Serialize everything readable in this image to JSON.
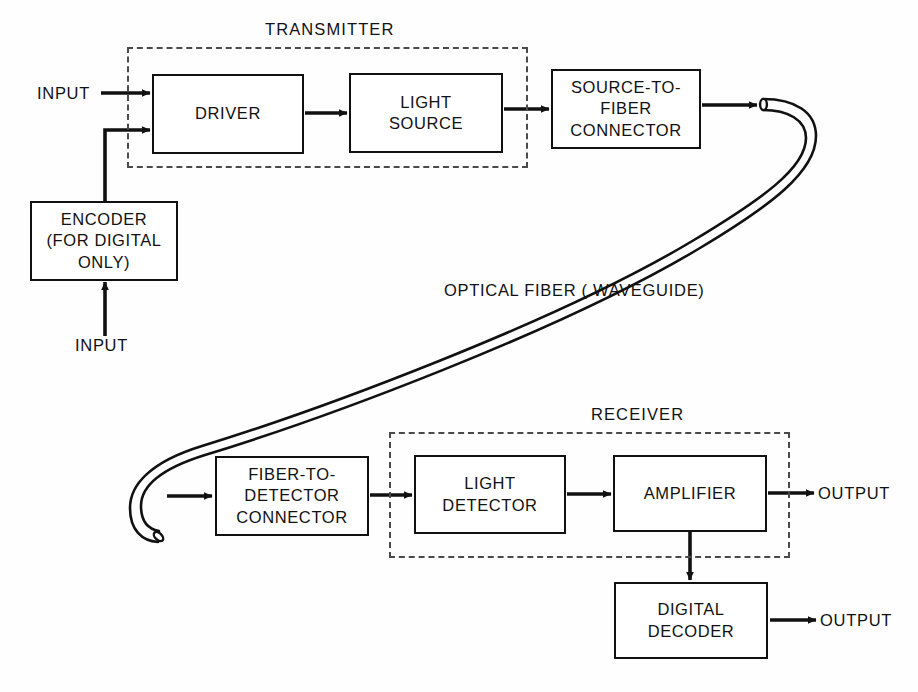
{
  "diagram": {
    "line_color": "#111111",
    "dash_color": "#4a4a4a",
    "background": "#fefefe"
  },
  "groups": {
    "transmitter": {
      "label": "TRANSMITTER"
    },
    "receiver": {
      "label": "RECEIVER"
    }
  },
  "blocks": {
    "driver": {
      "label": "DRIVER"
    },
    "light_source": {
      "label": "LIGHT\nSOURCE"
    },
    "source_to_fiber_connector": {
      "label": "SOURCE-TO-\nFIBER\nCONNECTOR"
    },
    "encoder": {
      "label": "ENCODER\n(FOR DIGITAL\nONLY)"
    },
    "fiber_to_detector_connector": {
      "label": "FIBER-TO-\nDETECTOR\nCONNECTOR"
    },
    "light_detector": {
      "label": "LIGHT\nDETECTOR"
    },
    "amplifier": {
      "label": "AMPLIFIER"
    },
    "digital_decoder": {
      "label": "DIGITAL\nDECODER"
    }
  },
  "labels": {
    "input_analog": "INPUT",
    "input_digital": "INPUT",
    "optical_fiber": "OPTICAL FIBER ( WAVEGUIDE)",
    "output_analog": "OUTPUT",
    "output_digital": "OUTPUT"
  }
}
